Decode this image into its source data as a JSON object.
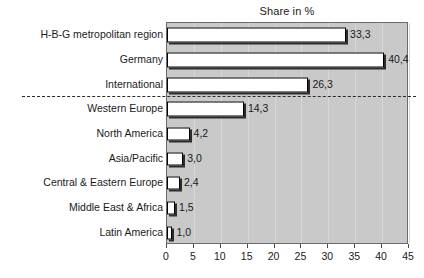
{
  "chart_data": {
    "type": "bar",
    "orientation": "horizontal",
    "title": "Share in %",
    "xlabel": "",
    "ylabel": "",
    "xlim": [
      0,
      45
    ],
    "xticks": [
      "0",
      "5",
      "10",
      "15",
      "20",
      "25",
      "30",
      "35",
      "40",
      "45"
    ],
    "grid": true,
    "legend": false,
    "categories": [
      "H-B-G metropolitan region",
      "Germany",
      "International",
      "Western Europe",
      "North America",
      "Asia/Pacific",
      "Central & Eastern Europe",
      "Middle East & Africa",
      "Latin America"
    ],
    "values": [
      33.3,
      40.4,
      26.3,
      14.3,
      4.2,
      3.0,
      2.4,
      1.5,
      1.0
    ],
    "value_labels": [
      "33,3",
      "40,4",
      "26,3",
      "14,3",
      "4,2",
      "3,0",
      "2,4",
      "1,5",
      "1,0"
    ],
    "annotations": [
      {
        "type": "dashed-separator",
        "after_category": "International"
      }
    ],
    "colors": {
      "plot_background": "#c9c9c9",
      "bar_fill": "#ffffff",
      "bar_border": "#000000",
      "gridline": "#d8d8d8",
      "axis": "#6b6b6b",
      "text": "#1a1a1a"
    }
  }
}
